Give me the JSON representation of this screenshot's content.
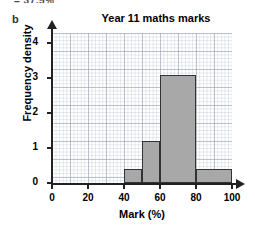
{
  "top_fragment": "= 37.5%",
  "part_label": "b",
  "chart_data": {
    "type": "bar",
    "title": "Year 11 maths marks",
    "xlabel": "Mark (%)",
    "ylabel": "Frequency density",
    "xlim": [
      0,
      100
    ],
    "ylim": [
      0,
      4.3
    ],
    "grid": true,
    "legend": null,
    "bar_color": "#a8a8a8",
    "bar_edge_color": "#333333",
    "x_ticks": [
      0,
      20,
      40,
      60,
      80,
      100
    ],
    "x_tick_labels": [
      "0",
      "20",
      "40",
      "60",
      "80",
      "100"
    ],
    "y_ticks": [
      0,
      1,
      2,
      3,
      4
    ],
    "y_tick_labels": [
      "0",
      "1",
      "2",
      "3",
      "4"
    ],
    "bins": [
      {
        "label": "40-50",
        "x_start": 40,
        "x_end": 50,
        "value": 0.4
      },
      {
        "label": "50-60",
        "x_start": 50,
        "x_end": 60,
        "value": 1.2
      },
      {
        "label": "60-80",
        "x_start": 60,
        "x_end": 80,
        "value": 3.1
      },
      {
        "label": "80-100",
        "x_start": 80,
        "x_end": 100,
        "value": 0.4
      }
    ],
    "categories": [
      "40-50",
      "50-60",
      "60-80",
      "80-100"
    ],
    "values": [
      0.4,
      1.2,
      3.1,
      0.4
    ]
  }
}
